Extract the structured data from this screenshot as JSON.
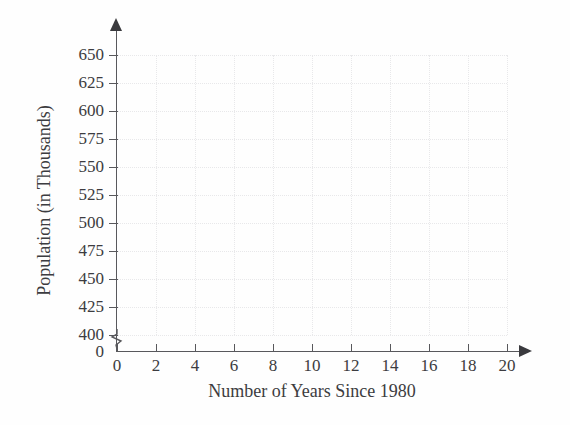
{
  "chart_data": {
    "type": "scatter",
    "title": "",
    "xlabel": "Number of Years Since 1980",
    "ylabel": "Population (in Thousands)",
    "xlim": [
      0,
      20
    ],
    "ylim": [
      400,
      650
    ],
    "y_axis_break": true,
    "y_break_from": 0,
    "y_break_to": 400,
    "grid": true,
    "legend": null,
    "x_ticks": [
      0,
      2,
      4,
      6,
      8,
      10,
      12,
      14,
      16,
      18,
      20
    ],
    "x_tick_labels": [
      "0",
      "2",
      "4",
      "6",
      "8",
      "10",
      "12",
      "14",
      "16",
      "18",
      "20"
    ],
    "y_ticks": [
      400,
      425,
      450,
      475,
      500,
      525,
      550,
      575,
      600,
      625,
      650
    ],
    "y_tick_labels": [
      "400",
      "425",
      "450",
      "475",
      "500",
      "525",
      "550",
      "575",
      "600",
      "625",
      "650"
    ],
    "y_origin_label": "0",
    "series": [
      {
        "name": "",
        "x": [],
        "y": []
      }
    ],
    "annotations": [],
    "colors": {
      "axis": "#58585c",
      "text": "#3c3c40",
      "grid": "#e8e8ea",
      "background": "#fefefe"
    }
  }
}
